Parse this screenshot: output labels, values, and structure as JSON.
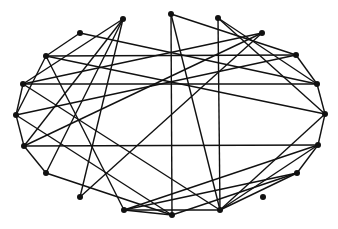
{
  "diagram": {
    "type": "network-graph",
    "layout": "circular",
    "colors": {
      "node": "#111111",
      "edge": "#111111",
      "background": "#ffffff"
    },
    "node_radius": 3,
    "nodes": [
      {
        "id": "n1",
        "x": 123,
        "y": 19
      },
      {
        "id": "n2",
        "x": 171,
        "y": 14
      },
      {
        "id": "n3",
        "x": 218,
        "y": 18
      },
      {
        "id": "n4",
        "x": 262,
        "y": 33
      },
      {
        "id": "n5",
        "x": 80,
        "y": 33
      },
      {
        "id": "n6",
        "x": 46,
        "y": 56
      },
      {
        "id": "n7",
        "x": 296,
        "y": 55
      },
      {
        "id": "n8",
        "x": 23,
        "y": 84
      },
      {
        "id": "n9",
        "x": 317,
        "y": 84
      },
      {
        "id": "n10",
        "x": 16,
        "y": 115
      },
      {
        "id": "n11",
        "x": 325,
        "y": 114
      },
      {
        "id": "n12",
        "x": 24,
        "y": 146
      },
      {
        "id": "n13",
        "x": 318,
        "y": 145
      },
      {
        "id": "n14",
        "x": 46,
        "y": 173
      },
      {
        "id": "n15",
        "x": 297,
        "y": 173
      },
      {
        "id": "n16",
        "x": 80,
        "y": 197
      },
      {
        "id": "n17",
        "x": 263,
        "y": 197
      },
      {
        "id": "n18",
        "x": 124,
        "y": 210
      },
      {
        "id": "n19",
        "x": 172,
        "y": 215
      },
      {
        "id": "n20",
        "x": 220,
        "y": 210
      }
    ],
    "edges": [
      [
        "n5",
        "n6"
      ],
      [
        "n5",
        "n9"
      ],
      [
        "n6",
        "n7"
      ],
      [
        "n6",
        "n11"
      ],
      [
        "n6",
        "n10"
      ],
      [
        "n6",
        "n18"
      ],
      [
        "n8",
        "n4"
      ],
      [
        "n8",
        "n9"
      ],
      [
        "n8",
        "n10"
      ],
      [
        "n8",
        "n20"
      ],
      [
        "n10",
        "n7"
      ],
      [
        "n10",
        "n12"
      ],
      [
        "n10",
        "n19"
      ],
      [
        "n1",
        "n8"
      ],
      [
        "n1",
        "n12"
      ],
      [
        "n1",
        "n14"
      ],
      [
        "n1",
        "n16"
      ],
      [
        "n2",
        "n19"
      ],
      [
        "n2",
        "n20"
      ],
      [
        "n2",
        "n7"
      ],
      [
        "n3",
        "n20"
      ],
      [
        "n3",
        "n11"
      ],
      [
        "n3",
        "n9"
      ],
      [
        "n4",
        "n12"
      ],
      [
        "n4",
        "n16"
      ],
      [
        "n7",
        "n9"
      ],
      [
        "n9",
        "n11"
      ],
      [
        "n11",
        "n13"
      ],
      [
        "n11",
        "n20"
      ],
      [
        "n12",
        "n13"
      ],
      [
        "n12",
        "n14"
      ],
      [
        "n13",
        "n15"
      ],
      [
        "n13",
        "n20"
      ],
      [
        "n13",
        "n18"
      ],
      [
        "n15",
        "n18"
      ],
      [
        "n15",
        "n19"
      ],
      [
        "n15",
        "n20"
      ],
      [
        "n14",
        "n19"
      ],
      [
        "n18",
        "n19"
      ],
      [
        "n18",
        "n20"
      ]
    ]
  }
}
